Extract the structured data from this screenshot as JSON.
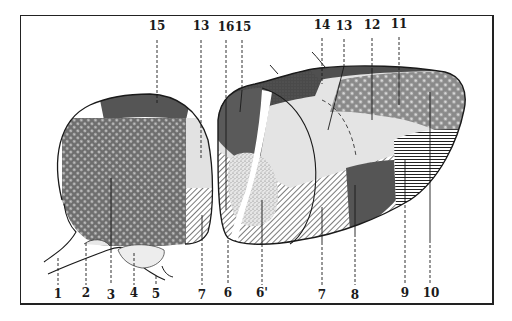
{
  "figure": {
    "type": "anatomical-section-illustration",
    "colors": {
      "ink": "#1a1a1a",
      "dark_fill": "#555555",
      "mid_fill": "#7a7a7a",
      "light_fill": "#dedede",
      "paper": "#ffffff"
    }
  },
  "labels": {
    "top": [
      {
        "id": "t15a",
        "text": "15",
        "x": 157,
        "y": 27,
        "line_to": 105
      },
      {
        "id": "t13a",
        "text": "13",
        "x": 201,
        "y": 27,
        "line_to": 158
      },
      {
        "id": "t16",
        "text": "16",
        "x": 226,
        "y": 28,
        "line_to": 210
      },
      {
        "id": "t15b",
        "text": "15",
        "x": 242,
        "y": 28,
        "line_to": 110
      },
      {
        "id": "t14",
        "text": "14",
        "x": 322,
        "y": 26,
        "line_to": 85
      },
      {
        "id": "t13b",
        "text": "13",
        "x": 344,
        "y": 27,
        "line_to": 130
      },
      {
        "id": "t12",
        "text": "12",
        "x": 372,
        "y": 26,
        "line_to": 120
      },
      {
        "id": "t11",
        "text": "11",
        "x": 399,
        "y": 25,
        "line_to": 105
      }
    ],
    "bottom": [
      {
        "id": "b1",
        "text": "1",
        "x": 58,
        "y": 290,
        "line_from": 258
      },
      {
        "id": "b2",
        "text": "2",
        "x": 86,
        "y": 290,
        "line_from": 243
      },
      {
        "id": "b3",
        "text": "3",
        "x": 111,
        "y": 291,
        "line_from": 178
      },
      {
        "id": "b4",
        "text": "4",
        "x": 134,
        "y": 290,
        "line_from": 253
      },
      {
        "id": "b5",
        "text": "5",
        "x": 156,
        "y": 290,
        "line_from": 276
      },
      {
        "id": "b7a",
        "text": "7",
        "x": 202,
        "y": 291,
        "line_from": 215
      },
      {
        "id": "b6",
        "text": "6",
        "x": 228,
        "y": 290,
        "line_from": 212
      },
      {
        "id": "b6p",
        "text": "6'",
        "x": 262,
        "y": 290,
        "line_from": 200
      },
      {
        "id": "b7b",
        "text": "7",
        "x": 322,
        "y": 291,
        "line_from": 207
      },
      {
        "id": "b8",
        "text": "8",
        "x": 355,
        "y": 291,
        "line_from": 185
      },
      {
        "id": "b9",
        "text": "9",
        "x": 405,
        "y": 290,
        "line_from": 160
      },
      {
        "id": "b10",
        "text": "10",
        "x": 430,
        "y": 290,
        "line_from": 95
      }
    ]
  }
}
